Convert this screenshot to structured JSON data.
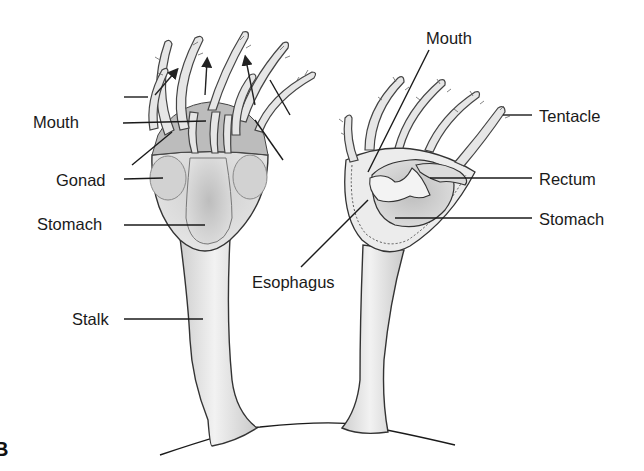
{
  "figure": {
    "letter": "B",
    "type": "Anatomical diagram of two stalked marine invertebrates (polyps)",
    "left_specimen": {
      "labels": [
        {
          "id": "mouth",
          "text": "Mouth"
        },
        {
          "id": "gonad",
          "text": "Gonad"
        },
        {
          "id": "stomach",
          "text": "Stomach"
        },
        {
          "id": "stalk",
          "text": "Stalk"
        }
      ]
    },
    "right_specimen": {
      "labels": [
        {
          "id": "mouth",
          "text": "Mouth"
        },
        {
          "id": "tentacle",
          "text": "Tentacle"
        },
        {
          "id": "rectum",
          "text": "Rectum"
        },
        {
          "id": "stomach",
          "text": "Stomach"
        },
        {
          "id": "esophagus",
          "text": "Esophagus"
        }
      ]
    }
  },
  "colors": {
    "background": "#ffffff",
    "body_fill": "#e4e4e4",
    "stomach_fill": "#c8c8c8",
    "line": "#1a1a1a"
  }
}
